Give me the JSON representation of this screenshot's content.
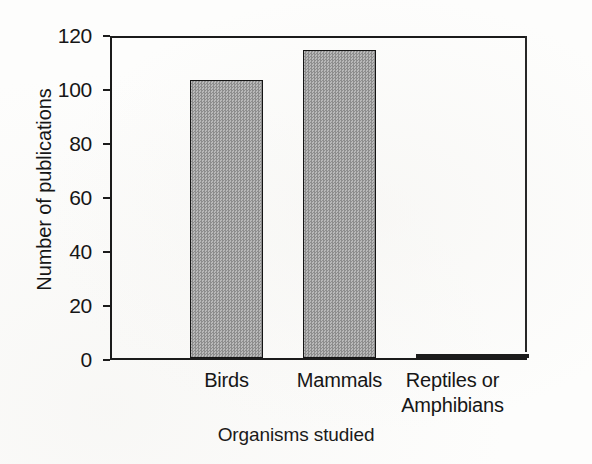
{
  "chart_data": {
    "type": "bar",
    "title": "",
    "subtitle": "",
    "xlabel": "Organisms studied",
    "ylabel": "Number of publications",
    "categories": [
      "Birds",
      "Mammals",
      "Reptiles or Amphibians"
    ],
    "category_lines": [
      [
        "Birds"
      ],
      [
        "Mammals"
      ],
      [
        "Reptiles or",
        "Amphibians"
      ]
    ],
    "values": [
      103,
      114,
      1
    ],
    "ylim": [
      0,
      120
    ],
    "yticks": [
      0,
      20,
      40,
      60,
      80,
      100,
      120
    ],
    "ytick_labels": [
      "0",
      "20",
      "40",
      "60",
      "80",
      "100",
      "120"
    ],
    "grid": false,
    "legend": false,
    "legend_position": "none",
    "orientation": "vertical",
    "bar_fill": "#9e9e9e",
    "bar_fill_pattern": "checkerboard-dither",
    "bar_edge_color": "#141414",
    "axis_color": "#1b1b1b",
    "background": "#fdfdfc"
  },
  "axes": {
    "y_title": "Number of publications",
    "x_title": "Organisms studied"
  },
  "icons": {
    "chart_icon": "bar-chart-icon"
  }
}
